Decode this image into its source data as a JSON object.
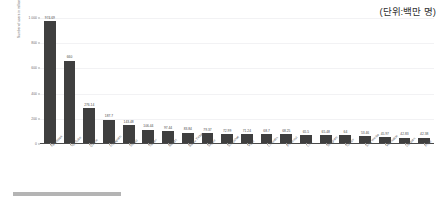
{
  "unit_note": "(단위:백만 명)",
  "bottom_strip": {
    "name": "scroll-indicator"
  },
  "chart_data": {
    "type": "bar",
    "title": "",
    "subtitle": "",
    "xlabel": "",
    "ylabel": "Number of users in millions",
    "ylim": [
      0,
      1000
    ],
    "grid": true,
    "legend": false,
    "unit_annotation": "(단위:백만 명)",
    "yticks": [
      0,
      200,
      400,
      600,
      800,
      1000
    ],
    "ytick_labels": [
      "0",
      "200",
      "400",
      "600",
      "800",
      "1 000"
    ],
    "categories": [
      "Facebook",
      "YouTube",
      "Qzone",
      "Instagram",
      "Weibo",
      "Twitter",
      "Reddit",
      "Baidu Tieba",
      "Skype",
      "Snapchat",
      "Viber",
      "LinkedIn",
      "Pinterest",
      "Line",
      "Telegram",
      "Tumblr",
      "Sina Weibo",
      "VKontakte",
      "Douban",
      "Flickr"
    ],
    "values": [
      974.69,
      660,
      276.14,
      187.7,
      143.48,
      106.44,
      97.44,
      83.84,
      79.37,
      72.99,
      71.24,
      68.7,
      68.25,
      65.5,
      65.48,
      64,
      53.46,
      45.97,
      42.83,
      42.38
    ],
    "value_labels": [
      "974.69",
      "660",
      "276.14",
      "187.7",
      "143.48",
      "106.44",
      "97.44",
      "83.84",
      "79.37",
      "72.99",
      "71.24",
      "68.7",
      "68.25",
      "65.5",
      "65.48",
      "64",
      "53.46",
      "45.97",
      "42.83",
      "42.38"
    ],
    "bar_color": "#3f3f3f",
    "grid_color": "#f2f2f4",
    "axis_color": "#4a4a4a",
    "background": "#ffffff"
  }
}
